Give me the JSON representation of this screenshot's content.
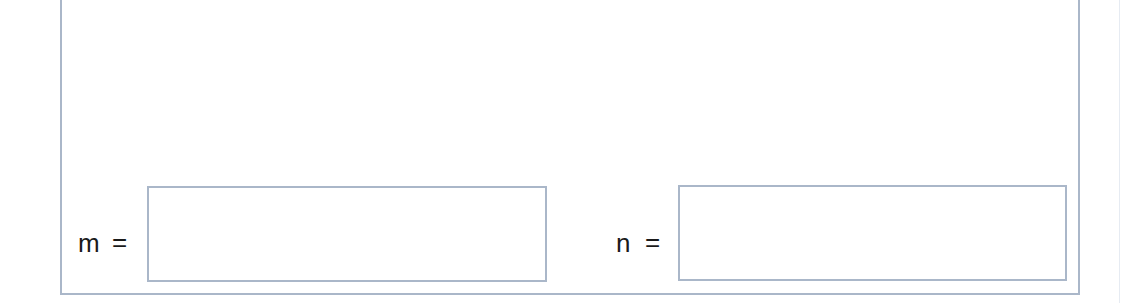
{
  "question": {
    "fields": [
      {
        "variable": "m",
        "operator": "=",
        "value": "",
        "placeholder": ""
      },
      {
        "variable": "n",
        "operator": "=",
        "value": "",
        "placeholder": ""
      }
    ]
  },
  "colors": {
    "border": "#aab7c9",
    "text": "#1a1a1a",
    "background": "#ffffff"
  }
}
